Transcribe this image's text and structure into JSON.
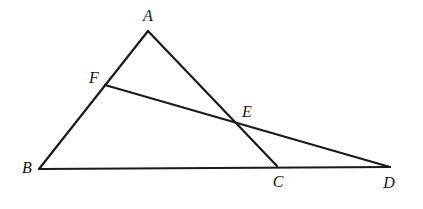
{
  "figure": {
    "kind": "geometry-diagram",
    "background_color": "#ffffff",
    "stroke_color": "#1a1a1a",
    "label_color": "#141414",
    "stroke_width": 2.2,
    "width": 423,
    "height": 209
  },
  "points": {
    "A": {
      "label": "A",
      "x": 148,
      "y": 31,
      "label_x": 148,
      "label_y": 16
    },
    "B": {
      "label": "B",
      "x": 39,
      "y": 169,
      "label_x": 27,
      "label_y": 168
    },
    "C": {
      "label": "C",
      "x": 277,
      "y": 166,
      "label_x": 278,
      "label_y": 182
    },
    "D": {
      "label": "D",
      "x": 390,
      "y": 167,
      "label_x": 389,
      "label_y": 183
    },
    "E": {
      "label": "E",
      "x": 238,
      "y": 124,
      "label_x": 247,
      "label_y": 112
    },
    "F": {
      "label": "F",
      "x": 105,
      "y": 85,
      "label_x": 94,
      "label_y": 78
    }
  },
  "segments": [
    {
      "name": "segment-AB",
      "from": "A",
      "to": "B"
    },
    {
      "name": "segment-AC",
      "from": "A",
      "to": "C"
    },
    {
      "name": "segment-BD",
      "from": "B",
      "to": "D"
    },
    {
      "name": "segment-FD",
      "from": "F",
      "to": "D"
    }
  ],
  "labels_order": [
    "A",
    "F",
    "E",
    "B",
    "C",
    "D"
  ]
}
